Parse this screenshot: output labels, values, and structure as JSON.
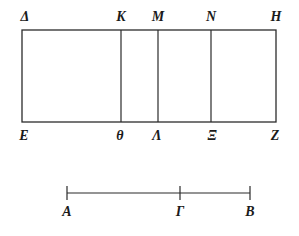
{
  "figure": {
    "background_color": "#ffffff",
    "stroke_color": "#2b2b2b",
    "label_color": "#1a1a1a"
  },
  "rectangle": {
    "name": "subdivided-rectangle",
    "left": 22,
    "right": 276,
    "top": 30,
    "bottom": 122,
    "width": 254,
    "height": 92,
    "dividers_x": [
      121,
      158,
      211
    ],
    "top_labels": [
      {
        "text": "Δ",
        "name": "label-delta",
        "x": 25,
        "y": 10
      },
      {
        "text": "K",
        "name": "label-kappa",
        "x": 121,
        "y": 10
      },
      {
        "text": "M",
        "name": "label-mu",
        "x": 158,
        "y": 10
      },
      {
        "text": "N",
        "name": "label-nu",
        "x": 211,
        "y": 10
      },
      {
        "text": "H",
        "name": "label-eta",
        "x": 276,
        "y": 10
      }
    ],
    "bottom_labels": [
      {
        "text": "E",
        "name": "label-epsilon",
        "x": 24,
        "y": 129
      },
      {
        "text": "θ",
        "name": "label-theta",
        "x": 120,
        "y": 129
      },
      {
        "text": "Λ",
        "name": "label-lambda",
        "x": 157,
        "y": 129
      },
      {
        "text": "Ξ",
        "name": "label-xi",
        "x": 212,
        "y": 129
      },
      {
        "text": "Z",
        "name": "label-zeta",
        "x": 275,
        "y": 129
      }
    ]
  },
  "segment": {
    "name": "measured-line-segment",
    "y": 193,
    "left": 67,
    "right": 250,
    "tick_half_height": 7,
    "ticks": [
      {
        "text": "A",
        "name": "label-a",
        "x": 67,
        "label_y": 205
      },
      {
        "text": "Γ",
        "name": "label-gamma",
        "x": 180,
        "label_y": 205
      },
      {
        "text": "B",
        "name": "label-b",
        "x": 250,
        "label_y": 205
      }
    ]
  }
}
